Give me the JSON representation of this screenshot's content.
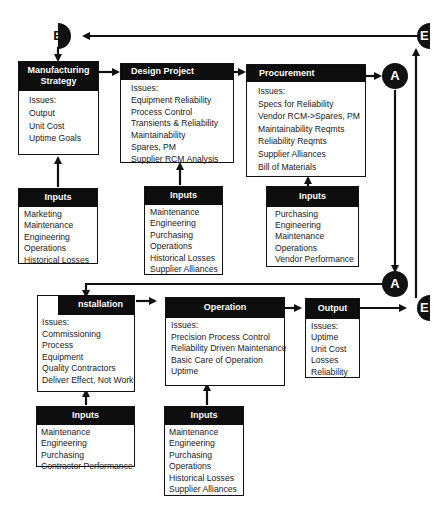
{
  "diagram": {
    "connectors": {
      "a_top": "A",
      "a_mid": "A",
      "b_left": "B",
      "e_top": "E",
      "e_bottom": "E"
    },
    "boxes": {
      "manufacturing_strategy": {
        "title": "Manufacturing Strategy",
        "items": [
          "Issues:",
          "Output",
          "Unit Cost",
          "Uptime Goals"
        ]
      },
      "design_project": {
        "title": "Design Project",
        "items": [
          "Issues:",
          "Equipment Reliability",
          "Process Control",
          "Transients & Reliability",
          "Maintainability",
          "Spares, PM",
          "Supplier RCM Analysis"
        ]
      },
      "procurement": {
        "title": "Procurement",
        "items": [
          "Issues:",
          "Specs for Reliability",
          "Vendor RCM->Spares, PM",
          "Maintainability Reqmts",
          "Reliability Reqmts",
          "Supplier Alliances",
          "Bill of Materials"
        ]
      },
      "installation": {
        "title": "nstallation",
        "items": [
          "Issues:",
          "Commissioning",
          "Process",
          "Equipment",
          "Quality Contractors",
          "Deliver Effect, Not Work"
        ]
      },
      "operation": {
        "title": "Operation",
        "items": [
          "Issues:",
          "Precision Process Control",
          "Reliability Driven Maintenance",
          "Basic Care of Operation",
          "Uptime",
          "Unit Cost of Production"
        ]
      },
      "output": {
        "title": "Output",
        "items": [
          "Issues:",
          "Uptime",
          "Unit Cost",
          "Losses",
          "Reliability"
        ]
      }
    },
    "inputs": {
      "manufacturing_strategy": {
        "title": "Inputs",
        "items": [
          "Marketing",
          "Maintenance",
          "Engineering",
          "Operations",
          "Historical Losses"
        ]
      },
      "design_project": {
        "title": "Inputs",
        "items": [
          "Maintenance",
          "Engineering",
          "Purchasing",
          "Operations",
          "Historical Losses",
          "Supplier Alliances"
        ]
      },
      "procurement": {
        "title": "Inputs",
        "items": [
          "Purchasing",
          "Engineering",
          "Maintenance",
          "Operations",
          "Vendor Performance"
        ]
      },
      "installation": {
        "title": "Inputs",
        "items": [
          "Maintenance",
          "Engineering",
          "Purchasing",
          "Contractor Performance"
        ]
      },
      "operation": {
        "title": "Inputs",
        "items": [
          "Maintenance",
          "Engineering",
          "Purchasing",
          "Operations",
          "Historical Losses",
          "Supplier Alliances"
        ]
      }
    }
  }
}
